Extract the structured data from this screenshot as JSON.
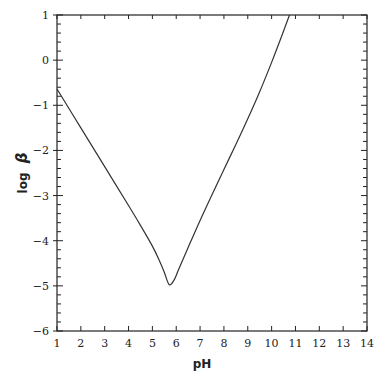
{
  "chart_data": {
    "type": "line",
    "title": "",
    "xlabel": "pH",
    "ylabel": "log β",
    "ylabel_parts": {
      "prefix": "log",
      "symbol": "β"
    },
    "xlim": [
      1,
      14
    ],
    "ylim": [
      -6,
      1
    ],
    "xticks": [
      1,
      2,
      3,
      4,
      5,
      6,
      7,
      8,
      9,
      10,
      11,
      12,
      13,
      14
    ],
    "yticks": [
      1,
      0,
      -1,
      -2,
      -3,
      -4,
      -5,
      -6
    ],
    "ytick_labels": [
      "1",
      "0",
      "−1",
      "−2",
      "−3",
      "−4",
      "−5",
      "−6"
    ],
    "grid": false,
    "legend": null,
    "series": [
      {
        "name": "log β vs pH",
        "x": [
          1.0,
          2.0,
          3.0,
          4.0,
          4.5,
          5.0,
          5.3,
          5.5,
          5.7,
          5.9,
          6.1,
          6.5,
          7.0,
          7.5,
          8.0,
          8.5,
          9.0,
          9.5,
          10.0,
          10.4,
          10.75
        ],
        "y": [
          -0.64,
          -1.5,
          -2.36,
          -3.22,
          -3.66,
          -4.12,
          -4.45,
          -4.7,
          -4.97,
          -4.88,
          -4.64,
          -4.15,
          -3.55,
          -2.98,
          -2.42,
          -1.87,
          -1.3,
          -0.7,
          -0.05,
          0.5,
          1.0
        ]
      }
    ]
  }
}
